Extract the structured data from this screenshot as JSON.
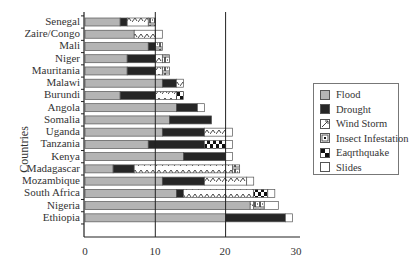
{
  "chart_data": {
    "type": "bar",
    "orientation": "horizontal",
    "stacked": true,
    "title": "",
    "xlabel": "",
    "ylabel": "Countries",
    "xlim": [
      0,
      30
    ],
    "xticks": [
      0,
      10,
      20,
      30
    ],
    "grid": {
      "vertical_lines_at": [
        10,
        20
      ]
    },
    "legend_position": "right",
    "categories": [
      "Senegal",
      "Zaire/Congo",
      "Mali",
      "Niger",
      "Mauritania",
      "Malawi",
      "Burundi",
      "Angola",
      "Somalia",
      "Uganda",
      "Tanzania",
      "Kenya",
      "Madagascar",
      "Mozambique",
      "South Africa",
      "Nigeria",
      "Ethiopia"
    ],
    "series": [
      {
        "name": "Flood",
        "pattern": "solid-gray",
        "values": [
          5,
          7,
          9,
          6,
          6,
          11,
          5,
          13,
          12,
          11,
          9,
          14,
          4,
          11,
          13,
          23.5,
          20
        ]
      },
      {
        "name": "Drought",
        "pattern": "solid-black",
        "values": [
          1,
          0,
          1,
          4,
          4,
          2,
          5,
          3,
          6,
          6,
          8,
          6,
          3,
          6,
          1,
          0,
          8.5
        ]
      },
      {
        "name": "Wind Storm",
        "pattern": "zigzag",
        "values": [
          3,
          3,
          0,
          1,
          1,
          1,
          3,
          0,
          0,
          3,
          0,
          0,
          14,
          6,
          10,
          0.5,
          0
        ]
      },
      {
        "name": "Insect Infestation",
        "pattern": "dots",
        "values": [
          1,
          0,
          1,
          1,
          1,
          0,
          0,
          0,
          0,
          0,
          0,
          0,
          1,
          0,
          0,
          1.5,
          0
        ]
      },
      {
        "name": "Eaqrthquake",
        "pattern": "checker",
        "values": [
          0,
          0,
          0,
          0,
          0,
          0,
          1,
          0,
          0,
          0,
          3,
          0,
          0,
          0,
          2,
          0,
          0
        ]
      },
      {
        "name": "Slides",
        "pattern": "white",
        "values": [
          0,
          1,
          0,
          0,
          0,
          0,
          0,
          1,
          0,
          1,
          1,
          1,
          0,
          1,
          1,
          2,
          1
        ]
      }
    ]
  },
  "axis": {
    "ylabel": "Countries",
    "xticks": [
      "0",
      "10",
      "20",
      "30"
    ]
  },
  "legend": {
    "items": [
      "Flood",
      "Drought",
      "Wind Storm",
      "Insect Infestation",
      "Eaqrthquake",
      "Slides"
    ]
  },
  "colors": {
    "flood": "#b4b4b4",
    "drought": "#262626",
    "outline": "#555555"
  }
}
